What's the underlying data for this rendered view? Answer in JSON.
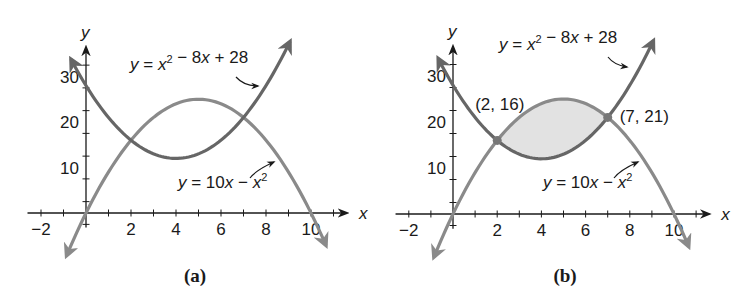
{
  "panels": [
    {
      "caption": "(a)",
      "y_axis_label": "y",
      "x_axis_label": "x",
      "x_ticks": [
        "−2",
        "2",
        "4",
        "6",
        "8",
        "10"
      ],
      "y_ticks": [
        "10",
        "20",
        "30"
      ],
      "curve1_label": {
        "pre": "y = x",
        "sup": "2",
        "post": " − 8x + 28"
      },
      "curve2_label": {
        "pre": "y = 10x − x",
        "sup": "2"
      }
    },
    {
      "caption": "(b)",
      "y_axis_label": "y",
      "x_axis_label": "x",
      "x_ticks": [
        "−2",
        "2",
        "4",
        "6",
        "8",
        "10"
      ],
      "y_ticks": [
        "10",
        "20",
        "30"
      ],
      "curve1_label": {
        "pre": "y = x",
        "sup": "2",
        "post": " − 8x + 28"
      },
      "curve2_label": {
        "pre": "y = 10x − x",
        "sup": "2"
      },
      "point1_label": "(2, 16)",
      "point2_label": "(7, 21)"
    }
  ],
  "colors": {
    "curve1": "#666666",
    "curve2": "#8a8a8a",
    "axis": "#1a1a1a",
    "shade": "#e2e2e2"
  },
  "chart_data": [
    {
      "type": "line",
      "title": "(a)",
      "xlabel": "x",
      "ylabel": "y",
      "xlim": [
        -2.5,
        11.5
      ],
      "ylim": [
        -3,
        35
      ],
      "grid": false,
      "x_ticks": [
        -2,
        2,
        4,
        6,
        8,
        10
      ],
      "y_ticks": [
        10,
        20,
        30
      ],
      "series": [
        {
          "name": "y = x^2 - 8x + 28",
          "x": [
            -0.5,
            0,
            1,
            2,
            3,
            4,
            5,
            6,
            7,
            8,
            9
          ],
          "values": [
            32.25,
            28,
            21,
            16,
            13,
            12,
            13,
            16,
            21,
            28,
            37
          ]
        },
        {
          "name": "y = 10x - x^2",
          "x": [
            -0.8,
            0,
            1,
            2,
            3,
            4,
            5,
            6,
            7,
            8,
            9,
            10,
            10.6
          ],
          "values": [
            -8.64,
            0,
            9,
            16,
            21,
            24,
            25,
            24,
            21,
            16,
            9,
            0,
            -6.36
          ]
        }
      ]
    },
    {
      "type": "line",
      "title": "(b)",
      "xlabel": "x",
      "ylabel": "y",
      "xlim": [
        -2.5,
        11.5
      ],
      "ylim": [
        -3,
        35
      ],
      "grid": false,
      "x_ticks": [
        -2,
        2,
        4,
        6,
        8,
        10
      ],
      "y_ticks": [
        10,
        20,
        30
      ],
      "series": [
        {
          "name": "y = x^2 - 8x + 28",
          "x": [
            -0.5,
            0,
            1,
            2,
            3,
            4,
            5,
            6,
            7,
            8,
            9
          ],
          "values": [
            32.25,
            28,
            21,
            16,
            13,
            12,
            13,
            16,
            21,
            28,
            37
          ]
        },
        {
          "name": "y = 10x - x^2",
          "x": [
            -0.8,
            0,
            1,
            2,
            3,
            4,
            5,
            6,
            7,
            8,
            9,
            10,
            10.6
          ],
          "values": [
            -8.64,
            0,
            9,
            16,
            21,
            24,
            25,
            24,
            21,
            16,
            9,
            0,
            -6.36
          ]
        }
      ],
      "annotations": [
        {
          "text": "(2, 16)",
          "x": 2,
          "y": 16
        },
        {
          "text": "(7, 21)",
          "x": 7,
          "y": 21
        }
      ],
      "shaded_region": {
        "between": [
          "y = 10x - x^2",
          "y = x^2 - 8x + 28"
        ],
        "x_from": 2,
        "x_to": 7
      }
    }
  ]
}
